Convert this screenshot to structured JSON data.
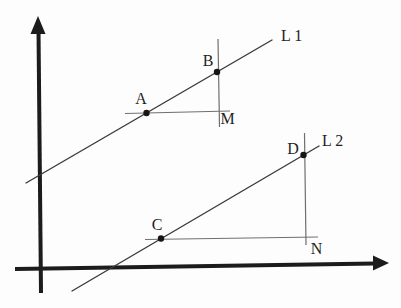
{
  "figure": {
    "colors": {
      "background": "#fdfdfd",
      "axis_ink": "#1c1c1c",
      "line_ink": "#3a3a3a",
      "construction_ink": "#6f6f6f",
      "label_ink": "#1f1f1f"
    },
    "labels": {
      "A": "A",
      "B": "B",
      "C": "C",
      "D": "D",
      "M": "M",
      "N": "N",
      "L1": "L 1",
      "L2": "L 2"
    }
  }
}
